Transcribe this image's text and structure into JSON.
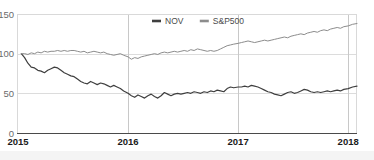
{
  "chart_data": {
    "type": "line",
    "title": "",
    "subtitle": "",
    "xlabel": "",
    "ylabel": "",
    "xlim": [
      2015.0,
      2018.08
    ],
    "ylim": [
      0,
      150
    ],
    "grid": true,
    "legend_position": "top-center",
    "x_ticks": [
      "2015",
      "2016",
      "2017",
      "2018"
    ],
    "x_tick_values": [
      2015,
      2016,
      2017,
      2018
    ],
    "y_ticks": [
      "0",
      "50",
      "100",
      "150"
    ],
    "y_tick_values": [
      0,
      50,
      100,
      150
    ],
    "colors": {
      "nov": "#3f3f3f",
      "sp500": "#8c8c8c",
      "grid": "#dcdcdc",
      "axis": "#4a4a4a",
      "frame": "#d9d9d9",
      "text": "#6b6b6b",
      "xtick_text": "#1b1b1b",
      "background": "#ffffff",
      "bottom_strip": "#f4f4f4"
    },
    "legend": [
      {
        "label": "NOV",
        "color": "#3f3f3f"
      },
      {
        "label": "S&P500",
        "color": "#8c8c8c"
      }
    ],
    "series": [
      {
        "name": "NOV",
        "color": "#3f3f3f",
        "x": [
          2015.03,
          2015.06,
          2015.09,
          2015.12,
          2015.15,
          2015.18,
          2015.21,
          2015.24,
          2015.27,
          2015.3,
          2015.33,
          2015.36,
          2015.39,
          2015.42,
          2015.45,
          2015.48,
          2015.51,
          2015.54,
          2015.57,
          2015.6,
          2015.63,
          2015.66,
          2015.69,
          2015.72,
          2015.75,
          2015.78,
          2015.81,
          2015.84,
          2015.87,
          2015.9,
          2015.93,
          2015.96,
          2016.0,
          2016.03,
          2016.06,
          2016.09,
          2016.12,
          2016.15,
          2016.18,
          2016.21,
          2016.24,
          2016.27,
          2016.3,
          2016.33,
          2016.36,
          2016.39,
          2016.42,
          2016.45,
          2016.48,
          2016.51,
          2016.54,
          2016.57,
          2016.6,
          2016.63,
          2016.66,
          2016.69,
          2016.72,
          2016.75,
          2016.78,
          2016.81,
          2016.84,
          2016.87,
          2016.9,
          2016.93,
          2016.96,
          2017.0,
          2017.03,
          2017.06,
          2017.09,
          2017.12,
          2017.15,
          2017.18,
          2017.21,
          2017.24,
          2017.27,
          2017.3,
          2017.33,
          2017.36,
          2017.39,
          2017.42,
          2017.45,
          2017.48,
          2017.51,
          2017.54,
          2017.57,
          2017.6,
          2017.63,
          2017.66,
          2017.69,
          2017.72,
          2017.75,
          2017.78,
          2017.81,
          2017.84,
          2017.87,
          2017.9,
          2017.93,
          2017.96,
          2018.0,
          2018.04,
          2018.08
        ],
        "values": [
          100,
          95,
          88,
          83,
          82,
          79,
          78,
          76,
          79,
          81,
          83,
          82,
          79,
          76,
          74,
          72,
          71,
          68,
          65,
          63,
          62,
          65,
          63,
          61,
          63,
          62,
          60,
          58,
          60,
          58,
          56,
          53,
          50,
          47,
          45,
          48,
          46,
          44,
          47,
          49,
          46,
          44,
          47,
          51,
          49,
          47,
          49,
          50,
          49,
          50,
          51,
          50,
          52,
          51,
          50,
          52,
          51,
          53,
          52,
          54,
          53,
          52,
          56,
          58,
          57,
          58,
          58,
          59,
          58,
          60,
          59,
          58,
          56,
          54,
          52,
          51,
          49,
          48,
          47,
          49,
          51,
          52,
          50,
          51,
          53,
          55,
          54,
          52,
          51,
          52,
          51,
          52,
          53,
          52,
          53,
          54,
          53,
          55,
          56,
          58,
          59
        ]
      },
      {
        "name": "S&P500",
        "color": "#8c8c8c",
        "x": [
          2015.03,
          2015.06,
          2015.09,
          2015.12,
          2015.15,
          2015.18,
          2015.21,
          2015.24,
          2015.27,
          2015.3,
          2015.33,
          2015.36,
          2015.39,
          2015.42,
          2015.45,
          2015.48,
          2015.51,
          2015.54,
          2015.57,
          2015.6,
          2015.63,
          2015.66,
          2015.69,
          2015.72,
          2015.75,
          2015.78,
          2015.81,
          2015.84,
          2015.87,
          2015.9,
          2015.93,
          2015.96,
          2016.0,
          2016.03,
          2016.06,
          2016.09,
          2016.12,
          2016.15,
          2016.18,
          2016.21,
          2016.24,
          2016.27,
          2016.3,
          2016.33,
          2016.36,
          2016.39,
          2016.42,
          2016.45,
          2016.48,
          2016.51,
          2016.54,
          2016.57,
          2016.6,
          2016.63,
          2016.66,
          2016.69,
          2016.72,
          2016.75,
          2016.78,
          2016.81,
          2016.84,
          2016.87,
          2016.9,
          2016.93,
          2016.96,
          2017.0,
          2017.03,
          2017.06,
          2017.09,
          2017.12,
          2017.15,
          2017.18,
          2017.21,
          2017.24,
          2017.27,
          2017.3,
          2017.33,
          2017.36,
          2017.39,
          2017.42,
          2017.45,
          2017.48,
          2017.51,
          2017.54,
          2017.57,
          2017.6,
          2017.63,
          2017.66,
          2017.69,
          2017.72,
          2017.75,
          2017.78,
          2017.81,
          2017.84,
          2017.87,
          2017.9,
          2017.93,
          2017.96,
          2018.0,
          2018.04,
          2018.08
        ],
        "values": [
          100,
          100,
          99,
          101,
          100,
          102,
          101,
          103,
          102,
          103,
          103,
          104,
          103,
          104,
          103,
          104,
          104,
          103,
          102,
          103,
          101,
          102,
          103,
          102,
          101,
          102,
          100,
          99,
          98,
          99,
          100,
          98,
          96,
          93,
          95,
          94,
          96,
          97,
          98,
          99,
          100,
          99,
          101,
          102,
          101,
          102,
          103,
          102,
          103,
          104,
          103,
          105,
          104,
          106,
          105,
          104,
          103,
          104,
          103,
          104,
          106,
          108,
          110,
          111,
          112,
          113,
          114,
          115,
          116,
          115,
          114,
          115,
          116,
          117,
          116,
          117,
          118,
          119,
          120,
          121,
          120,
          122,
          123,
          124,
          125,
          124,
          126,
          127,
          128,
          127,
          129,
          130,
          129,
          131,
          132,
          133,
          132,
          134,
          135,
          137,
          138
        ]
      }
    ]
  }
}
